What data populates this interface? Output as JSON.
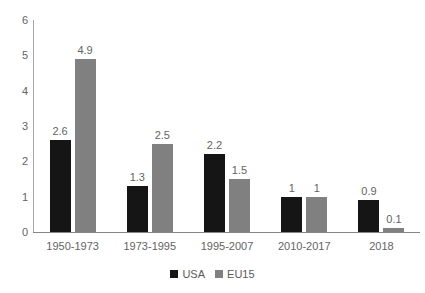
{
  "chart_data": {
    "type": "bar",
    "title": "",
    "subtitle": "",
    "xlabel": "",
    "ylabel": "",
    "ylim": [
      0,
      6
    ],
    "yticks": [
      "0",
      "1",
      "2",
      "3",
      "4",
      "5",
      "6"
    ],
    "grid": false,
    "legend_position": "bottom",
    "categories": [
      "1950-1973",
      "1973-1995",
      "1995-2007",
      "2010-2017",
      "2018"
    ],
    "series": [
      {
        "name": "USA",
        "color": "#151515",
        "values": [
          2.6,
          1.3,
          2.2,
          1,
          0.9
        ],
        "labels": [
          "2.6",
          "1.3",
          "2.2",
          "1",
          "0.9"
        ]
      },
      {
        "name": "EU15",
        "color": "#808080",
        "values": [
          4.9,
          2.5,
          1.5,
          1,
          0.1
        ],
        "labels": [
          "4.9",
          "2.5",
          "1.5",
          "1",
          "0.1"
        ]
      }
    ]
  },
  "legend": {
    "entries": [
      {
        "label": "USA",
        "color": "#151515"
      },
      {
        "label": "EU15",
        "color": "#808080"
      }
    ]
  },
  "axis": {
    "y_max": 6,
    "y_min": 0
  }
}
